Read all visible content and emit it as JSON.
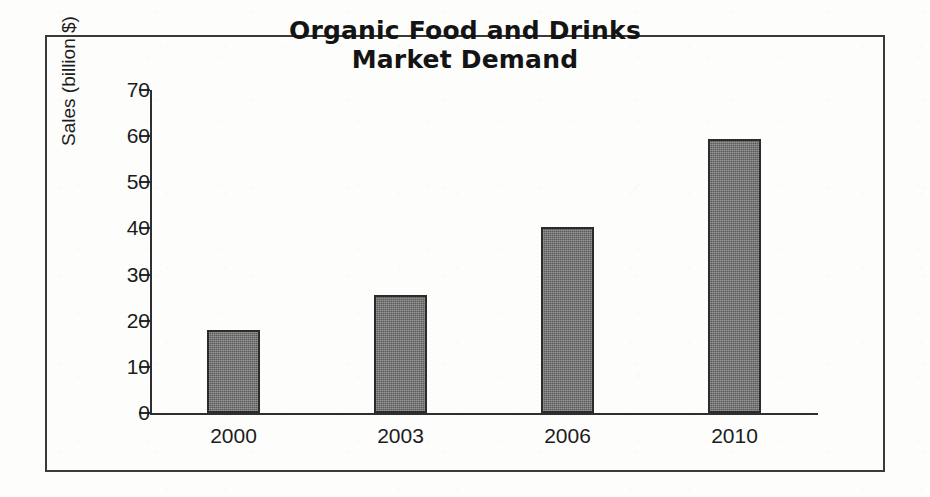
{
  "chart_data": {
    "type": "bar",
    "title": "Organic Food and Drinks Market Demand",
    "title_lines": [
      "Organic Food and Drinks",
      "Market Demand"
    ],
    "categories": [
      "2000",
      "2003",
      "2006",
      "2010"
    ],
    "values": [
      18,
      25.5,
      40.3,
      59.3
    ],
    "xlabel": "",
    "ylabel": "Sales (billion $)",
    "ylim": [
      0,
      70
    ],
    "ytick_step": 10,
    "yticks": [
      "70",
      "60",
      "50",
      "40",
      "30",
      "20",
      "10",
      "0"
    ],
    "ytick_values": [
      70,
      60,
      50,
      40,
      30,
      20,
      10,
      0
    ],
    "grid": false,
    "legend": false,
    "bar_fill_color": "#6f6f6f",
    "bar_edge_color": "#2b2b2b",
    "axis_color": "#2f2f2f",
    "frame_color": "#3a3a3a",
    "text_color": "#1c1c1c",
    "background_color": "#fdfdfc"
  }
}
